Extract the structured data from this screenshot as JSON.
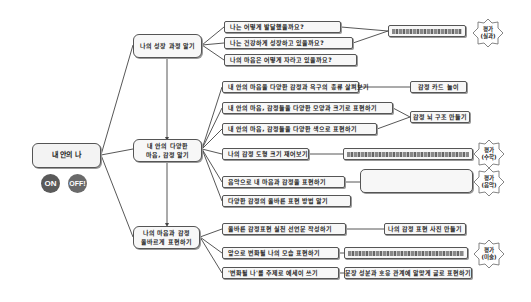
{
  "root": {
    "label": "내 안의 나"
  },
  "toggles": {
    "on": "ON",
    "off": "OFF!"
  },
  "branches": [
    {
      "label": "나의 성장 과정 알기",
      "children": [
        {
          "label": "나는 어떻게 발달했을까요?"
        },
        {
          "label": "나는 건강하게 성장하고 있을까요?"
        },
        {
          "label": "나의 마음은 어떻게 자라고 있을까요?"
        }
      ],
      "activity": {
        "redacted": true
      },
      "evaluation": {
        "line1": "평가",
        "line2": "(실과)"
      }
    },
    {
      "label_line1": "내 안의 다양한",
      "label_line2": "마음, 감정 알기",
      "children": [
        {
          "label": "내 안의 마음을 다양한 감정과 욕구의 종류 살펴보기"
        },
        {
          "label": "내 안의 마음, 감정들을 다양한 모양과 크기로 표현하기"
        },
        {
          "label": "내 안의 마음, 감정들을 다양한 색으로 표현하기"
        },
        {
          "label": "나의 감정 도형 크기 재어보기"
        },
        {
          "label": "음악으로 내 마음과 감정을 표현하기"
        },
        {
          "label": "다양한 감정의 올바른 표현 방법 알기"
        }
      ],
      "activities": [
        {
          "label": "감정 카드 놀이"
        },
        {
          "label": "감정 뇌 구조 만들기"
        }
      ],
      "evaluations": [
        {
          "line1": "평가",
          "line2": "(수학)"
        },
        {
          "line1": "평가",
          "line2": "(음악)"
        }
      ]
    },
    {
      "label_line1": "나의 마음과 감정",
      "label_line2": "올바르게 표현하기",
      "children": [
        {
          "label": "올바른 감정표현 실천 선언문 작성하기"
        },
        {
          "label": "앞으로 변화될 나의 모습 표현하기"
        },
        {
          "label": "'변화될 나'를 주제로 에세이 쓰기"
        }
      ],
      "activities": [
        {
          "label": "나의 감정 표현 사진 만들기"
        },
        {
          "label": "문장 성분과 호응 관계에 알맞게 글로 표현하기"
        }
      ],
      "evaluation": {
        "line1": "평가",
        "line2": "(미술)"
      }
    }
  ],
  "colors": {
    "node_border": "#555555",
    "node_bg": "#f7f7f7",
    "redacted": "#888888",
    "toggle": "#555555"
  }
}
